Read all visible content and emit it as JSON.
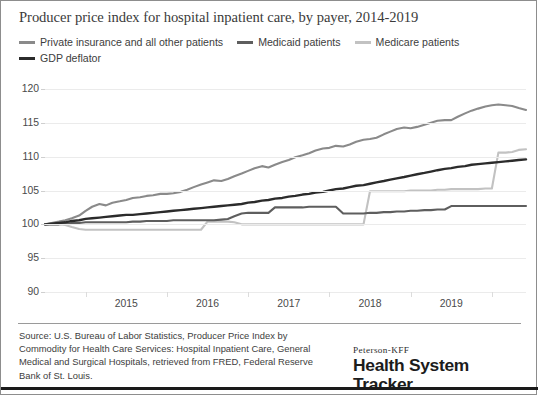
{
  "chart": {
    "title": "Producer price index for hospital inpatient care, by payer, 2014-2019"
  },
  "legend": {
    "rows": [
      [
        {
          "label": "Private insurance and all other patients",
          "color": "#8a8a8a",
          "swatch_name": "legend-swatch-private-insurance"
        },
        {
          "label": "Medicaid patients",
          "color": "#5e5e5e",
          "swatch_name": "legend-swatch-medicaid"
        },
        {
          "label": "Medicare patients",
          "color": "#c2c2c2",
          "swatch_name": "legend-swatch-medicare"
        }
      ],
      [
        {
          "label": "GDP deflator",
          "color": "#2b2b2b",
          "swatch_name": "legend-swatch-gdp-deflator"
        }
      ]
    ]
  },
  "footer": {
    "source": "Source: U.S. Bureau of Labor Statistics, Producer Price Index by Commodity for Health Care Services: Hospital Inpatient Care, General Medical and Surgical Hospitals, retrieved from FRED, Federal Reserve Bank of St. Louis.",
    "logo_kicker": "Peterson-KFF",
    "logo_main": "Health System Tracker"
  },
  "chart_data": {
    "type": "line",
    "title": "Producer price index for hospital inpatient care, by payer, 2014-2019",
    "xlabel": "",
    "ylabel": "",
    "ylim": [
      90,
      120
    ],
    "yticks": [
      90,
      95,
      100,
      105,
      110,
      115,
      120
    ],
    "xlim": [
      2014.0,
      2019.92
    ],
    "xticks": [
      2015,
      2016,
      2017,
      2018,
      2019
    ],
    "xticklabels": [
      "2015",
      "2016",
      "2017",
      "2018",
      "2019"
    ],
    "grid": true,
    "legend_position": "top-left",
    "x": [
      2014.0,
      2014.08,
      2014.17,
      2014.25,
      2014.33,
      2014.42,
      2014.5,
      2014.58,
      2014.67,
      2014.75,
      2014.83,
      2014.92,
      2015.0,
      2015.08,
      2015.17,
      2015.25,
      2015.33,
      2015.42,
      2015.5,
      2015.58,
      2015.67,
      2015.75,
      2015.83,
      2015.92,
      2016.0,
      2016.08,
      2016.17,
      2016.25,
      2016.33,
      2016.42,
      2016.5,
      2016.58,
      2016.67,
      2016.75,
      2016.83,
      2016.92,
      2017.0,
      2017.08,
      2017.17,
      2017.25,
      2017.33,
      2017.42,
      2017.5,
      2017.58,
      2017.67,
      2017.75,
      2017.83,
      2017.92,
      2018.0,
      2018.08,
      2018.17,
      2018.25,
      2018.33,
      2018.42,
      2018.5,
      2018.58,
      2018.67,
      2018.75,
      2018.83,
      2018.92,
      2019.0,
      2019.08,
      2019.17,
      2019.25,
      2019.33,
      2019.42,
      2019.5,
      2019.58,
      2019.67,
      2019.75,
      2019.83,
      2019.92
    ],
    "series": [
      {
        "name": "Private insurance and all other patients",
        "color": "#8a8a8a",
        "values": [
          100.0,
          100.2,
          100.4,
          100.6,
          100.9,
          101.3,
          102.0,
          102.6,
          103.0,
          102.8,
          103.2,
          103.4,
          103.6,
          103.9,
          104.0,
          104.2,
          104.3,
          104.5,
          104.5,
          104.6,
          104.8,
          105.1,
          105.5,
          105.9,
          106.2,
          106.5,
          106.4,
          106.7,
          107.1,
          107.5,
          107.9,
          108.3,
          108.6,
          108.4,
          108.8,
          109.2,
          109.5,
          109.9,
          110.2,
          110.5,
          110.9,
          111.2,
          111.3,
          111.6,
          111.5,
          111.8,
          112.2,
          112.5,
          112.6,
          112.8,
          113.3,
          113.7,
          114.1,
          114.3,
          114.2,
          114.4,
          114.7,
          115.0,
          115.3,
          115.4,
          115.4,
          115.9,
          116.4,
          116.8,
          117.1,
          117.4,
          117.6,
          117.7,
          117.6,
          117.5,
          117.2,
          116.9
        ]
      },
      {
        "name": "Medicaid patients",
        "color": "#5e5e5e",
        "values": [
          100.0,
          100.0,
          100.0,
          100.1,
          100.2,
          100.2,
          100.3,
          100.3,
          100.3,
          100.3,
          100.3,
          100.3,
          100.3,
          100.4,
          100.4,
          100.5,
          100.5,
          100.5,
          100.5,
          100.6,
          100.6,
          100.6,
          100.6,
          100.6,
          100.6,
          100.6,
          100.7,
          100.8,
          101.2,
          101.6,
          101.7,
          101.7,
          101.7,
          101.7,
          102.5,
          102.5,
          102.5,
          102.5,
          102.5,
          102.6,
          102.6,
          102.6,
          102.6,
          102.6,
          101.6,
          101.6,
          101.6,
          101.6,
          101.7,
          101.7,
          101.8,
          101.8,
          101.9,
          101.9,
          102.0,
          102.0,
          102.1,
          102.1,
          102.2,
          102.2,
          102.7,
          102.7,
          102.7,
          102.7,
          102.7,
          102.7,
          102.7,
          102.7,
          102.7,
          102.7,
          102.7,
          102.7
        ]
      },
      {
        "name": "Medicare patients",
        "color": "#c2c2c2",
        "values": [
          100.0,
          100.0,
          100.0,
          99.9,
          99.6,
          99.3,
          99.2,
          99.2,
          99.2,
          99.2,
          99.2,
          99.2,
          99.2,
          99.2,
          99.2,
          99.2,
          99.2,
          99.2,
          99.2,
          99.2,
          99.2,
          99.2,
          99.2,
          99.2,
          100.4,
          100.4,
          100.4,
          100.4,
          100.3,
          100.0,
          100.0,
          100.0,
          100.0,
          100.0,
          100.0,
          100.0,
          100.0,
          100.0,
          100.0,
          100.0,
          100.0,
          100.0,
          100.0,
          100.0,
          100.0,
          100.0,
          100.0,
          100.0,
          104.9,
          104.9,
          104.9,
          104.9,
          104.9,
          104.9,
          105.0,
          105.0,
          105.0,
          105.0,
          105.1,
          105.1,
          105.2,
          105.2,
          105.2,
          105.2,
          105.2,
          105.3,
          105.3,
          110.6,
          110.6,
          110.7,
          111.0,
          111.1
        ]
      },
      {
        "name": "GDP deflator",
        "color": "#2b2b2b",
        "values": [
          100.0,
          100.1,
          100.2,
          100.3,
          100.5,
          100.6,
          100.8,
          100.9,
          101.0,
          101.1,
          101.2,
          101.3,
          101.4,
          101.4,
          101.5,
          101.6,
          101.7,
          101.8,
          101.9,
          102.0,
          102.1,
          102.2,
          102.3,
          102.4,
          102.5,
          102.6,
          102.7,
          102.8,
          102.9,
          103.0,
          103.2,
          103.3,
          103.5,
          103.6,
          103.8,
          103.9,
          104.1,
          104.2,
          104.4,
          104.5,
          104.7,
          104.8,
          105.0,
          105.2,
          105.3,
          105.5,
          105.7,
          105.8,
          106.0,
          106.2,
          106.4,
          106.6,
          106.8,
          107.0,
          107.2,
          107.4,
          107.6,
          107.8,
          108.0,
          108.2,
          108.3,
          108.5,
          108.6,
          108.8,
          108.9,
          109.0,
          109.1,
          109.2,
          109.3,
          109.4,
          109.5,
          109.6
        ]
      }
    ]
  }
}
